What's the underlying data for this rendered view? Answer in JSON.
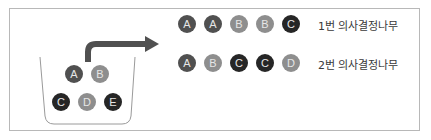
{
  "diagram": {
    "basket": {
      "balls": [
        {
          "label": "A",
          "tone": "dark"
        },
        {
          "label": "B",
          "tone": "mid"
        },
        {
          "label": "C",
          "tone": "black"
        },
        {
          "label": "D",
          "tone": "mid"
        },
        {
          "label": "E",
          "tone": "black"
        }
      ]
    },
    "arrow": {
      "direction": "right",
      "color": "#505050"
    },
    "samples": [
      {
        "label": "1번 의사결정나무",
        "balls": [
          {
            "label": "A",
            "tone": "dark"
          },
          {
            "label": "A",
            "tone": "dark"
          },
          {
            "label": "B",
            "tone": "mid"
          },
          {
            "label": "B",
            "tone": "mid"
          },
          {
            "label": "C",
            "tone": "black"
          }
        ]
      },
      {
        "label": "2번 의사결정나무",
        "balls": [
          {
            "label": "A",
            "tone": "dark"
          },
          {
            "label": "B",
            "tone": "mid"
          },
          {
            "label": "C",
            "tone": "black"
          },
          {
            "label": "C",
            "tone": "black"
          },
          {
            "label": "D",
            "tone": "mid"
          }
        ]
      }
    ],
    "colors": {
      "dark": "#505050",
      "mid": "#8e8e8e",
      "black": "#262626",
      "border": "#b8b8b8"
    }
  }
}
